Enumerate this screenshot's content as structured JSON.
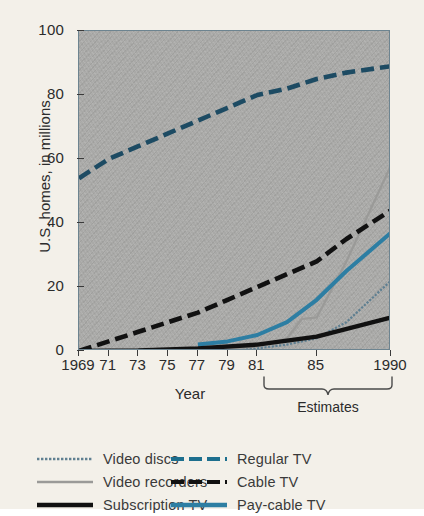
{
  "chart_data": {
    "type": "line",
    "title": "",
    "xlabel": "Year",
    "ylabel": "U.S. homes, in millions",
    "xlim": [
      1969,
      1990
    ],
    "ylim": [
      0,
      100
    ],
    "grid": false,
    "legend_position": "bottom",
    "y_ticks": [
      100,
      80,
      60,
      40,
      20,
      0
    ],
    "x_ticks": [
      {
        "value": 1969,
        "label": "1969"
      },
      {
        "value": 1971,
        "label": "71"
      },
      {
        "value": 1973,
        "label": "73"
      },
      {
        "value": 1975,
        "label": "75"
      },
      {
        "value": 1977,
        "label": "77"
      },
      {
        "value": 1979,
        "label": "79"
      },
      {
        "value": 1981,
        "label": "81"
      },
      {
        "value": 1985,
        "label": "85"
      },
      {
        "value": 1990,
        "label": "1990"
      }
    ],
    "annotations": [
      {
        "text": "Estimates",
        "type": "brace",
        "x_start": 1982,
        "x_end": 1990
      }
    ],
    "series": [
      {
        "name": "Video discs",
        "color": "#5f7f91",
        "style": "dotted-thin",
        "x": [
          1977,
          1979,
          1981,
          1983,
          1985,
          1987,
          1990
        ],
        "values": [
          0,
          0.3,
          0.8,
          2.0,
          4.0,
          9.0,
          22.0
        ]
      },
      {
        "name": "Video recorders",
        "color": "#9a9a98",
        "style": "solid-thin",
        "x": [
          1977,
          1979,
          1981,
          1983,
          1984,
          1985,
          1987,
          1990
        ],
        "values": [
          0,
          0.5,
          1.5,
          4.0,
          10.0,
          10.5,
          28.0,
          58.0
        ]
      },
      {
        "name": "Subscription TV",
        "color": "#111111",
        "style": "solid-thick",
        "x": [
          1969,
          1973,
          1977,
          1981,
          1985,
          1990
        ],
        "values": [
          0,
          0.2,
          0.8,
          2.0,
          4.5,
          10.5
        ]
      },
      {
        "name": "Regular TV",
        "color": "#1d4b63",
        "style": "dashed-thick",
        "x": [
          1969,
          1971,
          1973,
          1975,
          1977,
          1979,
          1981,
          1983,
          1985,
          1987,
          1990
        ],
        "values": [
          54,
          60,
          64,
          68,
          72,
          76,
          80,
          82,
          85,
          87,
          89
        ]
      },
      {
        "name": "Cable TV",
        "color": "#111111",
        "style": "dashed-thick",
        "x": [
          1969,
          1971,
          1973,
          1975,
          1977,
          1979,
          1981,
          1983,
          1985,
          1987,
          1990
        ],
        "values": [
          0,
          3,
          6,
          9,
          12,
          16,
          20,
          24,
          28,
          35,
          44
        ]
      },
      {
        "name": "Pay-cable TV",
        "color": "#2d7ea3",
        "style": "solid-med",
        "x": [
          1977,
          1979,
          1981,
          1983,
          1985,
          1987,
          1990
        ],
        "values": [
          2,
          3,
          5,
          9,
          16,
          25,
          37
        ]
      }
    ]
  },
  "legend": {
    "left_column": [
      {
        "label": "Video discs",
        "icon": "dotted-line-swatch"
      },
      {
        "label": "Video recorders",
        "icon": "thin-line-swatch"
      },
      {
        "label": "Subscription TV",
        "icon": "thick-line-swatch"
      }
    ],
    "right_column": [
      {
        "label": "Regular TV",
        "icon": "dashed-line-swatch"
      },
      {
        "label": "Cable TV",
        "icon": "dashed-line-swatch"
      },
      {
        "label": "Pay-cable TV",
        "icon": "solid-line-swatch"
      }
    ]
  },
  "colors": {
    "page_background": "#f3f0e9",
    "plot_background": "#a9a9a7",
    "regular_tv": "#1d4b63",
    "pay_cable_tv": "#2d7ea3",
    "cable_tv": "#111111",
    "subscription_tv": "#111111",
    "video_recorders": "#9a9a98",
    "video_discs": "#5f7f91"
  }
}
